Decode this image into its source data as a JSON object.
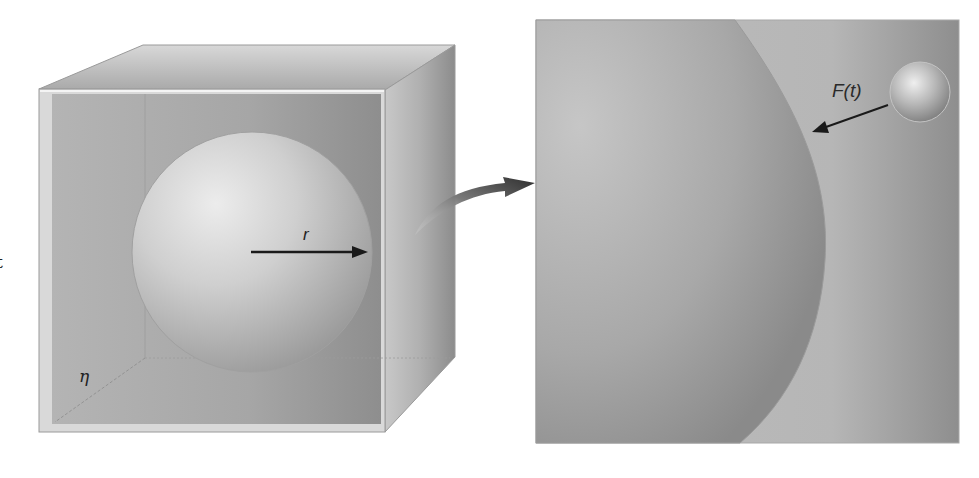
{
  "diagram": {
    "type": "physics-illustration",
    "left_panel": {
      "description": "Transparent cube of fluid containing a large sphere",
      "labels": {
        "radius": "r",
        "viscosity": "η",
        "edge_fragment": "t"
      }
    },
    "connector": {
      "description": "curved magnification arrow from cube side to zoomed inset"
    },
    "right_panel": {
      "description": "Magnified view of sphere surface with a small particle striking it",
      "labels": {
        "force": "F(t)"
      }
    },
    "colors": {
      "background": "#ffffff",
      "cube_face": "#a9a9a9",
      "cube_frame": "#d6d6d6",
      "sphere_light": "#e6e6e6",
      "sphere_dark": "#8f8f8f",
      "arrow": "#1a1a1a",
      "connector_arrow": "#3a3a3a"
    }
  }
}
